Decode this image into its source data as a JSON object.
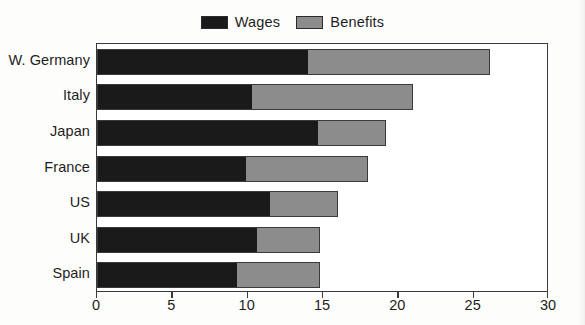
{
  "chart_data": {
    "type": "bar",
    "orientation": "horizontal",
    "stacked": true,
    "title": "",
    "subtitle": "",
    "xlabel": "",
    "ylabel": "",
    "xlim": [
      0,
      30
    ],
    "xticks": [
      0,
      5,
      10,
      15,
      20,
      25,
      30
    ],
    "xtick_labels": [
      "0",
      "5",
      "10",
      "15",
      "20",
      "25",
      "30"
    ],
    "grid": false,
    "legend_position": "top-center",
    "categories": [
      "W. Germany",
      "Italy",
      "Japan",
      "France",
      "US",
      "UK",
      "Spain"
    ],
    "series": [
      {
        "name": "Wages",
        "color": "#1a1a1a",
        "values": [
          14.0,
          10.3,
          14.7,
          9.9,
          11.5,
          10.6,
          9.3
        ]
      },
      {
        "name": "Benefits",
        "color": "#8c8c8c",
        "values": [
          12.1,
          10.7,
          4.5,
          8.1,
          4.5,
          4.2,
          5.5
        ]
      }
    ],
    "totals": [
      26.1,
      21.0,
      19.2,
      18.0,
      16.0,
      14.8,
      14.8
    ]
  },
  "legend": {
    "entries": [
      {
        "label": "Wages",
        "color": "#1a1a1a"
      },
      {
        "label": "Benefits",
        "color": "#8c8c8c"
      }
    ]
  },
  "colors": {
    "wages": "#1a1a1a",
    "benefits": "#8c8c8c",
    "frame": "#3a3a3a",
    "text": "#1d1d1d",
    "background": "#fdfdfc"
  }
}
